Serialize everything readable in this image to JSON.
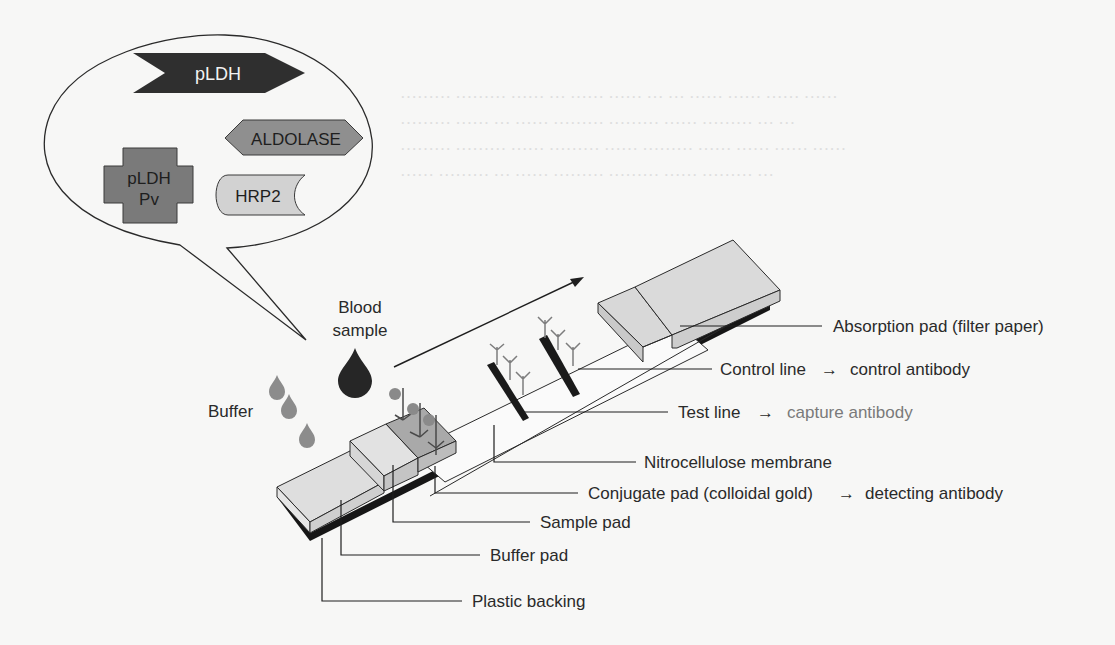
{
  "figure": {
    "colors": {
      "background": "#f7f7f6",
      "line": "#1e1e1e",
      "pad_fill": "#dcdcdc",
      "pad_side": "#c8c8c8",
      "conjugate_fill": "#a9a9a9",
      "backing": "#1a1a1a",
      "pldh_fill": "#2f2f2f",
      "aldolase_fill": "#8f8f8f",
      "pldh_pv_fill": "#7a7a7a",
      "hrp2_fill": "#cfcfcf",
      "blood_drop": "#2a2a2a",
      "buffer_drop": "#8c8c8c",
      "antibody": "#7d7d7d",
      "capture_text": "#7a7a7a"
    },
    "antigen_bubble": {
      "antigens": [
        {
          "id": "pldh",
          "label": "pLDH",
          "shape": "chevron-arrow"
        },
        {
          "id": "aldolase",
          "label": "ALDOLASE",
          "shape": "hexagon"
        },
        {
          "id": "pldh_pv",
          "label_line1": "pLDH",
          "label_line2": "Pv",
          "shape": "cross"
        },
        {
          "id": "hrp2",
          "label": "HRP2",
          "shape": "notched-tab"
        }
      ]
    },
    "inputs": {
      "blood_line1": "Blood",
      "blood_line2": "sample",
      "buffer": "Buffer"
    },
    "labels": {
      "absorption_pad": "Absorption pad (filter paper)",
      "control_line": "Control line",
      "control_antibody": "control antibody",
      "test_line": "Test line",
      "capture_antibody": "capture antibody",
      "nitrocellulose": "Nitrocellulose membrane",
      "conjugate_pad": "Conjugate pad (colloidal gold)",
      "detecting_antibody": "detecting antibody",
      "sample_pad": "Sample pad",
      "buffer_pad": "Buffer pad",
      "plastic_backing": "Plastic backing",
      "arrow": "→"
    }
  }
}
